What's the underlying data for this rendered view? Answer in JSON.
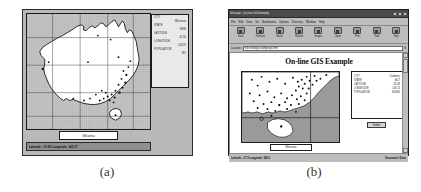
{
  "figure_a": {
    "name": "standalone-gis-viewer",
    "caption": "(a)",
    "map": {
      "region": "Australia",
      "view": "full-continent",
      "graticule": true
    },
    "attributes": {
      "fields": [
        {
          "label": "CITY",
          "value": "Wilcannia"
        },
        {
          "label": "STATE",
          "value": "NSW"
        },
        {
          "label": "LATITUDE",
          "value": "-31.56"
        },
        {
          "label": "LONGITUDE",
          "value": "143.37"
        },
        {
          "label": "POPULATION",
          "value": "967"
        }
      ]
    },
    "city_label_box": "Wilcannia",
    "statusbar": "Latitude: -31.56 Longitude: 143.37"
  },
  "figure_b": {
    "name": "netscape-gis-browser",
    "caption": "(b)",
    "browser": {
      "title": "Netscape - [On-line GIS Example]",
      "window_buttons": [
        "minimize",
        "maximize",
        "close"
      ],
      "menu": [
        "File",
        "Edit",
        "View",
        "Go",
        "Bookmarks",
        "Options",
        "Directory",
        "Window",
        "Help"
      ],
      "toolbar": [
        {
          "label": "Back",
          "icon": "back-arrow-icon"
        },
        {
          "label": "Forward",
          "icon": "forward-arrow-icon"
        },
        {
          "label": "Home",
          "icon": "home-icon"
        },
        {
          "label": "Reload",
          "icon": "reload-icon"
        },
        {
          "label": "Images",
          "icon": "images-icon"
        },
        {
          "label": "Open",
          "icon": "open-icon"
        },
        {
          "label": "Print",
          "icon": "print-icon"
        },
        {
          "label": "Find",
          "icon": "find-icon"
        },
        {
          "label": "Stop",
          "icon": "stop-icon"
        }
      ],
      "location": {
        "label": "Location:",
        "value": "http://www.gis.example/gis.html",
        "right_label": "N"
      }
    },
    "page": {
      "title": "On-line GIS Example",
      "city_label_box": "Wilcannia",
      "submit_button": "Submit",
      "attributes": {
        "fields": [
          {
            "label": "CITY",
            "value": "Canberra"
          },
          {
            "label": "STATE",
            "value": "ACT"
          },
          {
            "label": "LATITUDE",
            "value": "-35.28"
          },
          {
            "label": "LONGITUDE",
            "value": "149.13"
          },
          {
            "label": "POPULATION",
            "value": "310000"
          }
        ]
      },
      "map": {
        "region": "South-East Australia",
        "view": "zoomed-region",
        "includes": [
          "Tasmania",
          "Victoria",
          "New South Wales coast"
        ]
      }
    },
    "statusbar": {
      "left": "Latitude: -37.5 Longitude: 145.0",
      "right": "Document: Done"
    }
  }
}
